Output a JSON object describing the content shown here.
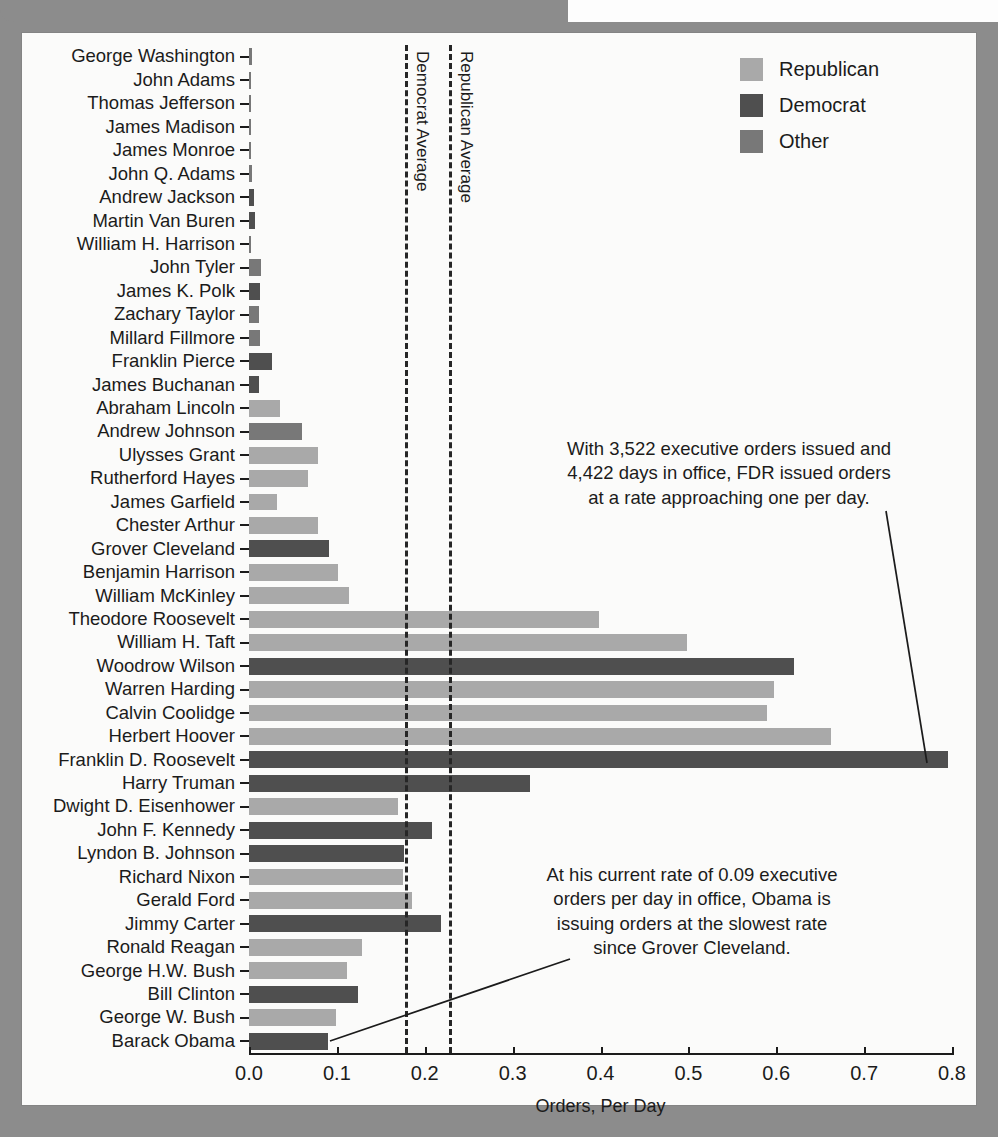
{
  "chart_data": {
    "type": "bar",
    "orientation": "horizontal",
    "title": "",
    "xlabel": "Orders, Per Day",
    "ylabel": "",
    "xlim": [
      0.0,
      0.8
    ],
    "xticks": [
      "0.0",
      "0.1",
      "0.2",
      "0.3",
      "0.4",
      "0.5",
      "0.6",
      "0.7",
      "0.8"
    ],
    "xtick_values": [
      0.0,
      0.1,
      0.2,
      0.3,
      0.4,
      0.5,
      0.6,
      0.7,
      0.8
    ],
    "grid": false,
    "legend_position": "top-right",
    "legend": [
      {
        "label": "Republican",
        "color": "#a9a9a9",
        "key": "rep"
      },
      {
        "label": "Democrat",
        "color": "#4f4f4f",
        "key": "dem"
      },
      {
        "label": "Other",
        "color": "#787878",
        "key": "other"
      }
    ],
    "categories": [
      "George Washington",
      "John Adams",
      "Thomas Jefferson",
      "James Madison",
      "James Monroe",
      "John Q. Adams",
      "Andrew Jackson",
      "Martin Van Buren",
      "William H. Harrison",
      "John Tyler",
      "James K. Polk",
      "Zachary Taylor",
      "Millard Fillmore",
      "Franklin Pierce",
      "James Buchanan",
      "Abraham Lincoln",
      "Andrew Johnson",
      "Ulysses Grant",
      "Rutherford Hayes",
      "James Garfield",
      "Chester Arthur",
      "Grover Cleveland",
      "Benjamin Harrison",
      "William McKinley",
      "Theodore Roosevelt",
      "William H. Taft",
      "Woodrow Wilson",
      "Warren Harding",
      "Calvin Coolidge",
      "Herbert Hoover",
      "Franklin D. Roosevelt",
      "Harry Truman",
      "Dwight D. Eisenhower",
      "John F. Kennedy",
      "Lyndon B. Johnson",
      "Richard Nixon",
      "Gerald Ford",
      "Jimmy Carter",
      "Ronald Reagan",
      "George H.W. Bush",
      "Bill Clinton",
      "George W. Bush",
      "Barack Obama"
    ],
    "values": [
      0.003,
      0.0,
      0.001,
      0.0,
      0.0,
      0.003,
      0.006,
      0.007,
      0.0,
      0.014,
      0.013,
      0.011,
      0.013,
      0.026,
      0.011,
      0.035,
      0.06,
      0.078,
      0.067,
      0.032,
      0.078,
      0.091,
      0.101,
      0.114,
      0.398,
      0.498,
      0.62,
      0.598,
      0.59,
      0.662,
      0.796,
      0.32,
      0.17,
      0.208,
      0.176,
      0.175,
      0.186,
      0.219,
      0.129,
      0.111,
      0.124,
      0.099,
      0.09
    ],
    "party": [
      "other",
      "other",
      "other",
      "other",
      "other",
      "other",
      "dem",
      "dem",
      "other",
      "other",
      "dem",
      "other",
      "other",
      "dem",
      "dem",
      "rep",
      "other",
      "rep",
      "rep",
      "rep",
      "rep",
      "dem",
      "rep",
      "rep",
      "rep",
      "rep",
      "dem",
      "rep",
      "rep",
      "rep",
      "dem",
      "dem",
      "rep",
      "dem",
      "dem",
      "rep",
      "rep",
      "dem",
      "rep",
      "rep",
      "dem",
      "rep",
      "dem"
    ],
    "reference_lines": [
      {
        "label": "Democrat Average",
        "value": 0.177
      },
      {
        "label": "Republican Average",
        "value": 0.228
      }
    ],
    "annotations": [
      {
        "id": "fdr",
        "lines": [
          "With 3,522 executive orders issued and",
          "4,422 days in office, FDR issued orders",
          "at a rate approaching one per day."
        ],
        "points_to": "Franklin D. Roosevelt"
      },
      {
        "id": "obama",
        "lines": [
          "At his current rate of 0.09 executive",
          "orders per day in office, Obama is",
          "issuing orders at the slowest rate",
          "since Grover Cleveland."
        ],
        "points_to": "Barack Obama"
      }
    ]
  }
}
